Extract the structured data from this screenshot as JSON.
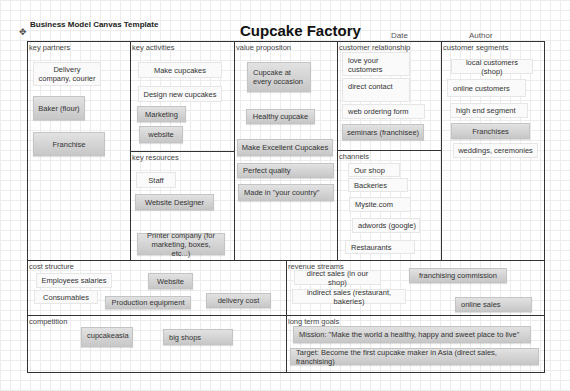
{
  "header": {
    "template_label": "Business Model Canvas Template",
    "title": "Cupcake Factory",
    "date_label": "Date",
    "author_label": "Author"
  },
  "sections": {
    "key_partners": {
      "label": "key partners",
      "notes": [
        "Delivery company, courier",
        "Baker (flour)",
        "Franchise"
      ]
    },
    "key_activities": {
      "label": "key activities",
      "notes": [
        "Make cupcakes",
        "Design new cupcakes",
        "Marketing",
        "website"
      ]
    },
    "key_resources": {
      "label": "key resources",
      "notes": [
        "Staff",
        "Website Designer",
        "Printer company (for marketing, boxes, etc...)"
      ]
    },
    "value_proposition": {
      "label": "value propositon",
      "notes": [
        "Cupcake at every occasion",
        "Healthy cupcake",
        "Make Excellent Cupcakes",
        "Perfect quality",
        "Made in \"your country\""
      ]
    },
    "customer_relationship": {
      "label": "customer relationship",
      "notes": [
        "love your customers",
        "direct contact",
        "web ordering form",
        "seminars (franchisee)"
      ]
    },
    "channels": {
      "label": "channels",
      "notes": [
        "Our shop",
        "Backeries",
        "Mysite.com",
        "adwords (google)",
        "Restaurants"
      ]
    },
    "customer_segments": {
      "label": "customer segments",
      "notes": [
        "local customers (shop)",
        "online customers",
        "high end segment",
        "Franchises",
        "weddings, ceremonies"
      ]
    },
    "cost_structure": {
      "label": "cost structure",
      "notes": [
        "Employees salaries",
        "Website",
        "Consumables",
        "Production equipment",
        "delivery cost"
      ]
    },
    "revenue_streams": {
      "label": "revenue streams",
      "notes": [
        "direct sales (in our shop)",
        "franchising commission",
        "indirect sales (restaurant, bakeries)",
        "online sales"
      ]
    },
    "competition": {
      "label": "competition",
      "notes": [
        "cupcakeasia",
        "big shops"
      ]
    },
    "long_term_goals": {
      "label": "long term goals",
      "notes": [
        "Mission: \"Make the world a healthy, happy and sweet place to live\"",
        "Target: Become the first cupcake maker in Asia (direct sales, franchising)"
      ]
    }
  },
  "colors": {
    "frame": "#333333",
    "note_gray_top": "#e2e2e2",
    "note_gray_bottom": "#c7c7c7",
    "note_plain": "#fafafa",
    "grid": "#ececec"
  },
  "icons": {
    "move": "move-handle-icon"
  }
}
